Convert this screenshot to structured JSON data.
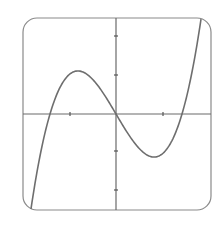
{
  "chart_data": {
    "type": "line",
    "title": "",
    "xlabel": "",
    "ylabel": "",
    "frame": {
      "x0": 23,
      "y0": 18,
      "x1": 211,
      "y1": 210,
      "radius": 14,
      "stroke": "#7a7a7a"
    },
    "origin_px": {
      "x": 116,
      "y": 114
    },
    "x_ticks_px": [
      70,
      163
    ],
    "y_ticks_px": [
      36,
      75,
      151,
      190
    ],
    "tick_units": {
      "x_px_per_unit": 46.5,
      "y_px_per_unit": 38.5
    },
    "xlim": [
      -2,
      2
    ],
    "ylim": [
      -2.5,
      2.5
    ],
    "grid": false,
    "legend": null,
    "series": [
      {
        "name": "f(x)",
        "formula_px": "y = 3.89e-4 * x * (x^2 - 4356)",
        "roots_units": [
          -1.42,
          0,
          1.42
        ],
        "local_max_units": {
          "x": -0.8,
          "y": 1.12
        },
        "local_min_units": {
          "x": 0.8,
          "y": -1.12
        },
        "x": [
          -1.83,
          -1.6,
          -1.42,
          -1.2,
          -1.0,
          -0.8,
          -0.6,
          -0.4,
          -0.2,
          0,
          0.2,
          0.4,
          0.6,
          0.8,
          1.0,
          1.2,
          1.42,
          1.6,
          1.83
        ],
        "y": [
          -2.46,
          -1.06,
          0,
          0.75,
          1.08,
          1.12,
          0.98,
          0.72,
          0.37,
          0,
          -0.37,
          -0.72,
          -0.98,
          -1.12,
          -1.08,
          -0.75,
          0,
          1.06,
          2.46
        ],
        "color": "#6e6e6e"
      }
    ]
  }
}
